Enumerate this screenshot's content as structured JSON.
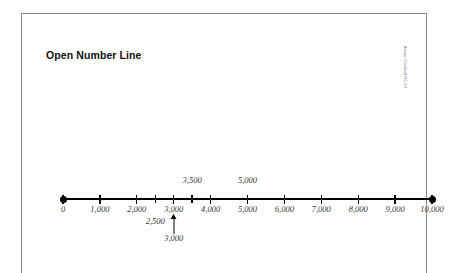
{
  "page": {
    "title": "Open Number Line",
    "attribution": "Answer Overhead MC 3.9"
  },
  "chart_data": {
    "type": "line",
    "title": "Open Number Line",
    "xlabel": "",
    "ylabel": "",
    "xlim": [
      0,
      10000
    ],
    "grid": false,
    "legend": null,
    "axis_endpoints": {
      "left_value": 0,
      "right_value": 10000,
      "left_marker": "filled-dot",
      "right_marker": "filled-dot"
    },
    "major_ticks": [
      {
        "value": 0,
        "label": "0"
      },
      {
        "value": 1000,
        "label": "1,000"
      },
      {
        "value": 2000,
        "label": "2,000"
      },
      {
        "value": 3000,
        "label": "3,000"
      },
      {
        "value": 4000,
        "label": "4,000"
      },
      {
        "value": 5000,
        "label": "5,000"
      },
      {
        "value": 6000,
        "label": "6,000"
      },
      {
        "value": 7000,
        "label": "7,000"
      },
      {
        "value": 8000,
        "label": "8,000"
      },
      {
        "value": 9000,
        "label": "9,000"
      },
      {
        "value": 10000,
        "label": "10,000"
      }
    ],
    "minor_ticks": [
      {
        "value": 2500,
        "label": ""
      },
      {
        "value": 3500,
        "label": ""
      }
    ],
    "annotations_above": [
      {
        "value": 3500,
        "label": "3,500"
      },
      {
        "value": 5000,
        "label": "5,000"
      }
    ],
    "annotations_below": [
      {
        "value": 2500,
        "label": "2,500"
      },
      {
        "value": 3000,
        "label": "3,000",
        "marker": "arrow-up"
      }
    ]
  }
}
